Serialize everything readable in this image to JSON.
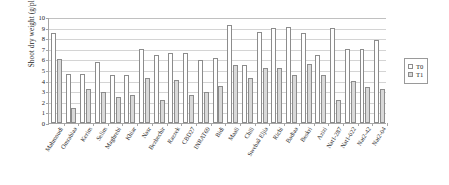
{
  "chart_data": {
    "type": "bar",
    "title": "",
    "xlabel": "",
    "ylabel": "Shoot dry weight (g/plant)",
    "ylim": [
      0,
      10
    ],
    "ytick_step": 1,
    "yticks": [
      "0",
      "1",
      "2",
      "3",
      "4",
      "5",
      "6",
      "7",
      "8",
      "9",
      "10"
    ],
    "grid": true,
    "legend_position": "right",
    "categories": [
      "Mahmoudi",
      "Omrabiaa",
      "Kerim",
      "Selim",
      "Maghrebi",
      "Khiar",
      "Nasr",
      "Bezbechir",
      "Razzek",
      "CBD27",
      "INRAT69",
      "Bidi",
      "Maali",
      "Chili",
      "Swebaâ Eljia",
      "Richi",
      "Badiaa",
      "Beskri",
      "Azizi",
      "Nat1-287",
      "Nat1-022",
      "Nat2-42",
      "Nat2-04"
    ],
    "series": [
      {
        "name": "T0",
        "color": "#ffffff",
        "values": [
          8.5,
          4.6,
          4.65,
          5.8,
          4.5,
          4.55,
          7.0,
          6.45,
          6.6,
          6.6,
          5.9,
          6.15,
          9.2,
          5.5,
          8.6,
          9.0,
          9.1,
          8.5,
          6.45,
          9.0,
          7.0,
          7.0,
          7.8
        ]
      },
      {
        "name": "T1",
        "color": "#d9d9d9",
        "values": [
          6.0,
          1.4,
          3.2,
          2.9,
          2.5,
          2.6,
          4.2,
          2.2,
          4.1,
          2.6,
          2.9,
          3.5,
          5.5,
          4.2,
          5.2,
          5.2,
          4.5,
          5.6,
          4.5,
          2.2,
          4.0,
          3.4,
          3.2
        ]
      }
    ]
  },
  "legend": {
    "items": [
      {
        "label": "T0",
        "key": "t0"
      },
      {
        "label": "T1",
        "key": "t1"
      }
    ]
  }
}
